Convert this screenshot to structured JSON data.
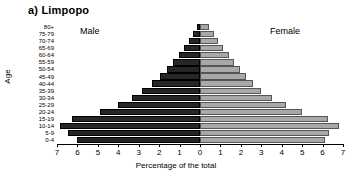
{
  "chart_data": {
    "type": "bar",
    "subtype": "population-pyramid",
    "title": "a) Limpopo",
    "xlabel": "Percentage of the total",
    "ylabel": "Age",
    "xlim": [
      -7,
      7
    ],
    "x_axis_ticks": [
      "7",
      "6",
      "5",
      "4",
      "3",
      "2",
      "1",
      "0",
      "1",
      "2",
      "3",
      "4",
      "5",
      "6",
      "7"
    ],
    "x_axis_tick_values": [
      -7,
      -6,
      -5,
      -4,
      -3,
      -2,
      -1,
      0,
      1,
      2,
      3,
      4,
      5,
      6,
      7
    ],
    "grid": false,
    "legend_position": "inside-top",
    "categories": [
      "0-4",
      "5-9",
      "10-14",
      "15-19",
      "20-24",
      "25-29",
      "30-34",
      "35-39",
      "40-44",
      "45-49",
      "50-54",
      "55-59",
      "60-64",
      "65-69",
      "70-74",
      "75-79",
      "80+"
    ],
    "series": [
      {
        "name": "Male",
        "color": "#262626",
        "side": "left",
        "values": [
          6.0,
          6.45,
          6.85,
          6.25,
          4.9,
          4.0,
          3.35,
          2.85,
          2.35,
          1.95,
          1.6,
          1.3,
          1.05,
          0.8,
          0.55,
          0.35,
          0.15
        ]
      },
      {
        "name": "Female",
        "color": "#a8a8a8",
        "side": "right",
        "values": [
          6.1,
          6.3,
          6.8,
          6.25,
          5.0,
          4.2,
          3.5,
          3.0,
          2.6,
          2.25,
          1.95,
          1.65,
          1.4,
          1.15,
          0.9,
          0.7,
          0.45
        ]
      }
    ]
  },
  "chart": {
    "title": "a) Limpopo",
    "male_label": "Male",
    "female_label": "Female",
    "x_axis_title": "Percentage of the total",
    "y_axis_title": "Age"
  }
}
